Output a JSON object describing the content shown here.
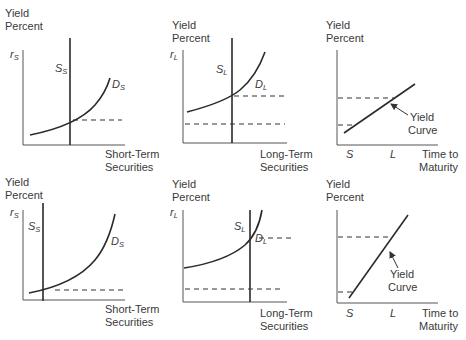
{
  "figure": {
    "panels": [
      {
        "id": "top-short-term",
        "y_label_line1": "Yield",
        "y_label_line2": "Percent",
        "rate_symbol": "r",
        "rate_sub": "S",
        "supply_symbol": "S",
        "supply_sub": "S",
        "demand_symbol": "D",
        "demand_sub": "S",
        "x_label_line1": "Short-Term",
        "x_label_line2": "Securities"
      },
      {
        "id": "top-long-term",
        "y_label_line1": "Yield",
        "y_label_line2": "Percent",
        "rate_symbol": "r",
        "rate_sub": "L",
        "supply_symbol": "S",
        "supply_sub": "L",
        "demand_symbol": "D",
        "demand_sub": "L",
        "x_label_line1": "Long-Term",
        "x_label_line2": "Securities"
      },
      {
        "id": "top-yield-curve",
        "y_label_line1": "Yield",
        "y_label_line2": "Percent",
        "curve_label_line1": "Yield",
        "curve_label_line2": "Curve",
        "tick_s": "S",
        "tick_l": "L",
        "x_label_line1": "Time to",
        "x_label_line2": "Maturity"
      },
      {
        "id": "bottom-short-term",
        "y_label_line1": "Yield",
        "y_label_line2": "Percent",
        "rate_symbol": "r",
        "rate_sub": "S",
        "supply_symbol": "S",
        "supply_sub": "S",
        "demand_symbol": "D",
        "demand_sub": "S",
        "x_label_line1": "Short-Term",
        "x_label_line2": "Securities"
      },
      {
        "id": "bottom-long-term",
        "y_label_line1": "Yield",
        "y_label_line2": "Percent",
        "rate_symbol": "r",
        "rate_sub": "L",
        "supply_symbol": "S",
        "supply_sub": "L",
        "demand_symbol": "D",
        "demand_sub": "L",
        "x_label_line1": "Long-Term",
        "x_label_line2": "Securities"
      },
      {
        "id": "bottom-yield-curve",
        "y_label_line1": "Yield",
        "y_label_line2": "Percent",
        "curve_label_line1": "Yield",
        "curve_label_line2": "Curve",
        "tick_s": "S",
        "tick_l": "L",
        "x_label_line1": "Time to",
        "x_label_line2": "Maturity"
      }
    ]
  }
}
